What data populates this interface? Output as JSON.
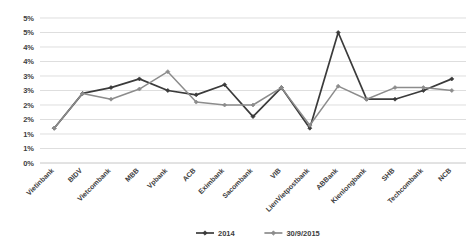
{
  "chart_data": {
    "type": "line",
    "title": "",
    "subtitle": "",
    "xlabel": "",
    "ylabel": "",
    "ylim": [
      0,
      0.05
    ],
    "grid": true,
    "legend_position": "bottom",
    "ytick_labels": [
      "0%",
      "1%",
      "1%",
      "2%",
      "2%",
      "3%",
      "3%",
      "4%",
      "4%",
      "5%",
      "5%"
    ],
    "ytick_values": [
      0,
      0.005,
      0.01,
      0.015,
      0.02,
      0.025,
      0.03,
      0.035,
      0.04,
      0.045,
      0.05
    ],
    "categories": [
      "Vietinbank",
      "BIDV",
      "Vietcombank",
      "MBB",
      "Vpbank",
      "ACB",
      "Eximbank",
      "Sacombank",
      "VIB",
      "LienVietpostbank",
      "ABBank",
      "Kienlongbank",
      "SHB",
      "Techcombank",
      "NCB"
    ],
    "series": [
      {
        "name": "2014",
        "color": "#3b3b3b",
        "marker": "diamond",
        "values": [
          1.2,
          2.4,
          2.6,
          2.9,
          2.5,
          2.35,
          2.7,
          1.6,
          2.6,
          1.2,
          4.5,
          2.2,
          2.2,
          2.5,
          2.9
        ]
      },
      {
        "name": "30/9/2015",
        "color": "#8c8c8c",
        "marker": "diamond",
        "values": [
          1.2,
          2.4,
          2.2,
          2.55,
          3.15,
          2.1,
          2.0,
          2.0,
          2.6,
          1.3,
          2.65,
          2.2,
          2.6,
          2.6,
          2.5
        ]
      }
    ]
  },
  "legend": {
    "entries": [
      {
        "label": "2014"
      },
      {
        "label": "30/9/2015"
      }
    ]
  }
}
